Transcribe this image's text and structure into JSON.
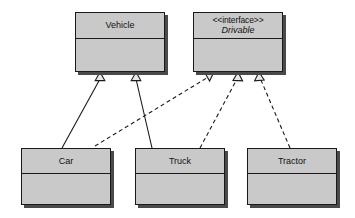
{
  "diagram": {
    "kind": "uml-class-diagram",
    "canvas": {
      "width": 355,
      "height": 218,
      "background": "#ffffff"
    },
    "style": {
      "box_fill": "#c9c9c9",
      "box_border": "#1a1a1a",
      "box_shadow": "#4a4a4a",
      "line_color": "#1a1a1a",
      "text_color": "#111111",
      "dash_pattern": "4,3"
    },
    "classes": [
      {
        "id": "vehicle",
        "name": "Vehicle",
        "stereotype": "",
        "italic": false,
        "x": 75,
        "y": 12,
        "w": 90,
        "h": 60,
        "name_h": 26
      },
      {
        "id": "drivable",
        "name": "Drivable",
        "stereotype": "<<interface>>",
        "italic": true,
        "x": 193,
        "y": 12,
        "w": 90,
        "h": 60,
        "name_h": 26
      },
      {
        "id": "car",
        "name": "Car",
        "stereotype": "",
        "italic": false,
        "x": 21,
        "y": 148,
        "w": 90,
        "h": 57,
        "name_h": 25
      },
      {
        "id": "truck",
        "name": "Truck",
        "stereotype": "",
        "italic": false,
        "x": 135,
        "y": 148,
        "w": 90,
        "h": 57,
        "name_h": 25
      },
      {
        "id": "tractor",
        "name": "Tractor",
        "stereotype": "",
        "italic": false,
        "x": 247,
        "y": 148,
        "w": 90,
        "h": 57,
        "name_h": 25
      }
    ],
    "relationships": [
      {
        "id": "car-extends-vehicle",
        "type": "generalization",
        "line": "solid",
        "source": "car",
        "target": "vehicle",
        "from_x": 62,
        "from_y": 148,
        "to_x": 100,
        "to_y": 72
      },
      {
        "id": "truck-extends-vehicle",
        "type": "generalization",
        "line": "solid",
        "source": "truck",
        "target": "vehicle",
        "from_x": 152,
        "from_y": 148,
        "to_x": 136,
        "to_y": 72
      },
      {
        "id": "car-implements-drivable",
        "type": "realization",
        "line": "dashed",
        "source": "car",
        "target": "drivable",
        "from_x": 95,
        "from_y": 146,
        "to_x": 214,
        "to_y": 72
      },
      {
        "id": "truck-implements-drivable",
        "type": "realization",
        "line": "dashed",
        "source": "truck",
        "target": "drivable",
        "from_x": 200,
        "from_y": 148,
        "to_x": 238,
        "to_y": 72
      },
      {
        "id": "tractor-implements-drivable",
        "type": "realization",
        "line": "dashed",
        "source": "tractor",
        "target": "drivable",
        "from_x": 290,
        "from_y": 148,
        "to_x": 259,
        "to_y": 72
      }
    ]
  }
}
